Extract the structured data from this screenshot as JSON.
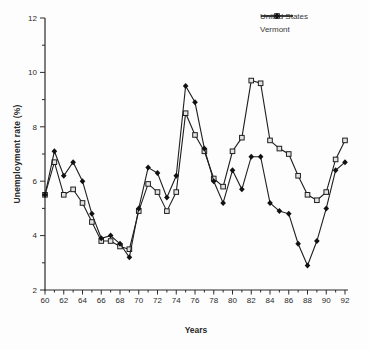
{
  "chart_data": {
    "type": "line",
    "title": "",
    "xlabel": "Years",
    "ylabel": "Unemployment rate (%)",
    "x": [
      1960,
      1961,
      1962,
      1963,
      1964,
      1965,
      1966,
      1967,
      1968,
      1969,
      1970,
      1971,
      1972,
      1973,
      1974,
      1975,
      1976,
      1977,
      1978,
      1979,
      1980,
      1981,
      1982,
      1983,
      1984,
      1985,
      1986,
      1987,
      1988,
      1989,
      1990,
      1991,
      1992
    ],
    "x_tick_labels": [
      "60",
      "62",
      "64",
      "66",
      "68",
      "70",
      "72",
      "74",
      "76",
      "78",
      "80",
      "82",
      "84",
      "86",
      "88",
      "90",
      "92"
    ],
    "xlim": [
      1960,
      1992
    ],
    "ylim": [
      2,
      12
    ],
    "y_ticks": [
      2,
      4,
      6,
      8,
      10,
      12
    ],
    "grid": false,
    "legend_position": "top-right",
    "axis_color": "#2a2a2a",
    "background_color": "#fdfdfd",
    "series": [
      {
        "name": "United States",
        "marker": "open-square",
        "color": "#1f1f1f",
        "marker_fill": "#e3e3e3",
        "values": [
          5.5,
          6.7,
          5.5,
          5.7,
          5.2,
          4.5,
          3.8,
          3.8,
          3.6,
          3.5,
          4.9,
          5.9,
          5.6,
          4.9,
          5.6,
          8.5,
          7.7,
          7.1,
          6.1,
          5.8,
          7.1,
          7.6,
          9.7,
          9.6,
          7.5,
          7.2,
          7.0,
          6.2,
          5.5,
          5.3,
          5.6,
          6.8,
          7.5
        ]
      },
      {
        "name": "Vermont",
        "marker": "filled-diamond",
        "color": "#1f1f1f",
        "marker_fill": "#111111",
        "values": [
          5.5,
          7.1,
          6.2,
          6.7,
          6.0,
          4.8,
          3.9,
          4.0,
          3.7,
          3.2,
          5.0,
          6.5,
          6.3,
          5.4,
          6.2,
          9.5,
          8.9,
          7.2,
          6.0,
          5.2,
          6.4,
          5.7,
          6.9,
          6.9,
          5.2,
          4.9,
          4.8,
          3.7,
          2.9,
          3.8,
          5.0,
          6.4,
          6.7
        ]
      }
    ]
  }
}
